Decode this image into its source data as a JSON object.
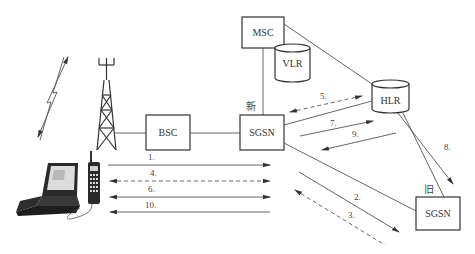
{
  "diagram": {
    "nodes": {
      "bsc": "BSC",
      "sgsn_new": "SGSN",
      "sgsn_new_tag": "新",
      "msc": "MSC",
      "vlr": "VLR",
      "hlr": "HLR",
      "sgsn_old": "SGSN",
      "sgsn_old_tag": "旧"
    },
    "icons": {
      "tower": "radio-tower-icon",
      "lightning": "radio-signal-icon",
      "terminal": "laptop-with-mobile-phone-icon"
    },
    "messages": [
      {
        "id": "1",
        "label": "1.",
        "from": "MS",
        "to": "SGSN(new)",
        "style": "solid",
        "direction": "right"
      },
      {
        "id": "2",
        "label": "2.",
        "from": "SGSN(new)",
        "to": "SGSN(old)",
        "style": "solid",
        "direction": "to-old"
      },
      {
        "id": "3",
        "label": "3.",
        "from": "SGSN(old)",
        "to": "SGSN(new)",
        "style": "dashed",
        "direction": "to-new"
      },
      {
        "id": "4",
        "label": "4.",
        "from": "MS",
        "to": "SGSN(new)",
        "style": "dashed",
        "direction": "both"
      },
      {
        "id": "5",
        "label": "5.",
        "from": "SGSN(new)",
        "to": "HLR",
        "style": "dashed",
        "direction": "both"
      },
      {
        "id": "6",
        "label": "6.",
        "from": "MS",
        "to": "SGSN(new)",
        "style": "solid",
        "direction": "both"
      },
      {
        "id": "7",
        "label": "7.",
        "from": "SGSN(new)",
        "to": "HLR",
        "style": "solid",
        "direction": "to-hlr"
      },
      {
        "id": "8",
        "label": "8.",
        "from": "HLR",
        "to": "SGSN(old)",
        "style": "solid",
        "direction": "to-old"
      },
      {
        "id": "9",
        "label": "9.",
        "from": "HLR",
        "to": "SGSN(new)",
        "style": "solid",
        "direction": "to-new"
      },
      {
        "id": "10",
        "label": "10.",
        "from": "SGSN(new)",
        "to": "MS",
        "style": "solid",
        "direction": "left"
      }
    ],
    "colors": {
      "line": "#555555",
      "box_stroke": "#333333",
      "background": "#ffffff"
    }
  }
}
